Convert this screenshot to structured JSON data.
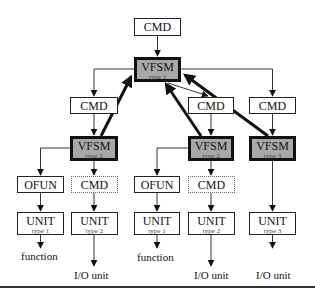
{
  "diagram": {
    "top_cmd": {
      "label": "CMD"
    },
    "vfsm_root": {
      "label": "VFSM",
      "subtitle": "type 1"
    },
    "branch_left": {
      "cmd": {
        "label": "CMD"
      },
      "vfsm": {
        "label": "VFSM",
        "subtitle": "type 2"
      },
      "ofun": {
        "label": "OFUN"
      },
      "cmd_dashed": {
        "label": "CMD"
      },
      "unit_a": {
        "label": "UNIT",
        "subtitle": "type 1"
      },
      "unit_b": {
        "label": "UNIT",
        "subtitle": "type 2"
      },
      "out_a": "function",
      "out_b": "I/O unit"
    },
    "branch_middle": {
      "cmd": {
        "label": "CMD"
      },
      "vfsm": {
        "label": "VFSM",
        "subtitle": "type 2"
      },
      "ofun": {
        "label": "OFUN"
      },
      "cmd_dashed": {
        "label": "CMD"
      },
      "unit_a": {
        "label": "UNIT",
        "subtitle": "type 1"
      },
      "unit_b": {
        "label": "UNIT",
        "subtitle": "type 2"
      },
      "out_a": "function",
      "out_b": "I/O unit"
    },
    "branch_right": {
      "cmd": {
        "label": "CMD"
      },
      "vfsm": {
        "label": "VFSM",
        "subtitle": "type 3"
      },
      "unit": {
        "label": "UNIT",
        "subtitle": "type 3"
      },
      "out": "I/O unit"
    },
    "colors": {
      "vfsm_fill": "#a8a8a8",
      "line": "#222222",
      "box_fill": "#ffffff"
    }
  }
}
